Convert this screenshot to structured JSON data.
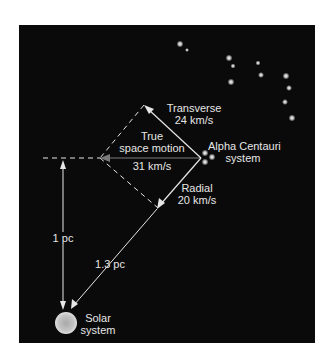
{
  "figure": {
    "labels": {
      "transverse": "Transverse",
      "transverse_speed": "24 km/s",
      "true_motion_line1": "True",
      "true_motion_line2": "space motion",
      "true_motion_speed": "31 km/s",
      "star_system_line1": "Alpha Centauri",
      "star_system_line2": "system",
      "radial": "Radial",
      "radial_speed": "20 km/s",
      "distance_perpendicular": "1 pc",
      "distance_direct": "1.3 pc",
      "solar_line1": "Solar",
      "solar_line2": "system"
    },
    "colors": {
      "background": "#0a0a0a",
      "line": "#e6e6e6",
      "true_motion_arrow": "#7a7a7a",
      "sun": "#bdbdbd"
    },
    "icons": {
      "stars": "star-cluster-icon",
      "sun": "sun-icon"
    }
  }
}
